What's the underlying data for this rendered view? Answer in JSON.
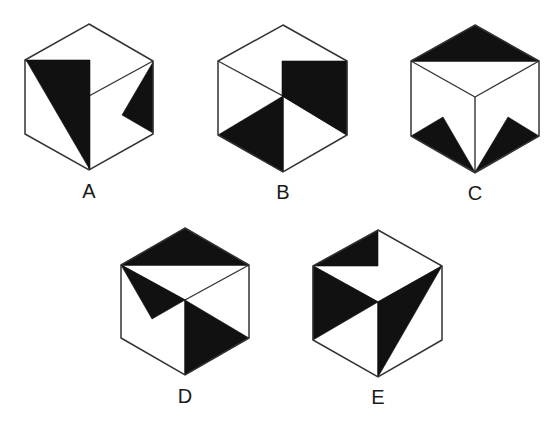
{
  "diagram": {
    "stroke_color": "#333333",
    "fill_color": "#111111",
    "background": "#ffffff",
    "cubes": [
      {
        "id": "A",
        "label": "A",
        "label_pos": [
          89,
          181
        ],
        "outline": [
          [
            89,
            24
          ],
          [
            153,
            61
          ],
          [
            153,
            134
          ],
          [
            89,
            170
          ],
          [
            25,
            134
          ],
          [
            25,
            60
          ]
        ],
        "edges": [
          [
            [
              89,
              96
            ],
            [
              153,
              61
            ]
          ],
          [
            [
              89,
              96
            ],
            [
              89,
              170
            ]
          ],
          [
            [
              25,
              60
            ],
            [
              89,
              96
            ]
          ]
        ],
        "shaded": [
          [
            [
              26,
              60
            ],
            [
              90,
              60
            ],
            [
              90,
              170
            ]
          ],
          [
            [
              153,
              62
            ],
            [
              122,
              115
            ],
            [
              153,
              133
            ]
          ]
        ]
      },
      {
        "id": "B",
        "label": "B",
        "label_pos": [
          283,
          182
        ],
        "outline": [
          [
            283,
            25
          ],
          [
            347,
            61
          ],
          [
            347,
            135
          ],
          [
            283,
            172
          ],
          [
            218,
            135
          ],
          [
            218,
            61
          ]
        ],
        "edges": [
          [
            [
              218,
              61
            ],
            [
              283,
              96
            ]
          ],
          [
            [
              283,
              96
            ],
            [
              283,
              172
            ]
          ],
          [
            [
              283,
              96
            ],
            [
              347,
              135
            ]
          ]
        ],
        "shaded": [
          [
            [
              282,
              61
            ],
            [
              347,
              61
            ],
            [
              347,
              135
            ],
            [
              282,
              96
            ]
          ],
          [
            [
              218,
              135
            ],
            [
              283,
              96
            ],
            [
              283,
              172
            ]
          ]
        ]
      },
      {
        "id": "C",
        "label": "C",
        "label_pos": [
          475,
          183
        ],
        "outline": [
          [
            475,
            25
          ],
          [
            539,
            61
          ],
          [
            539,
            136
          ],
          [
            475,
            173
          ],
          [
            411,
            136
          ],
          [
            411,
            61
          ]
        ],
        "edges": [
          [
            [
              411,
              61
            ],
            [
              475,
              97
            ]
          ],
          [
            [
              475,
              97
            ],
            [
              539,
              61
            ]
          ],
          [
            [
              475,
              97
            ],
            [
              475,
              173
            ]
          ],
          [
            [
              411,
              61
            ],
            [
              539,
              61
            ]
          ]
        ],
        "shaded": [
          [
            [
              475,
              25
            ],
            [
              411,
              61
            ],
            [
              539,
              61
            ]
          ],
          [
            [
              411,
              136
            ],
            [
              443,
              117
            ],
            [
              475,
              172
            ]
          ],
          [
            [
              475,
              172
            ],
            [
              508,
              117
            ],
            [
              539,
              136
            ]
          ]
        ]
      },
      {
        "id": "D",
        "label": "D",
        "label_pos": [
          185,
          386
        ],
        "outline": [
          [
            185,
            228
          ],
          [
            249,
            265
          ],
          [
            249,
            338
          ],
          [
            185,
            375
          ],
          [
            121,
            338
          ],
          [
            121,
            265
          ]
        ],
        "edges": [
          [
            [
              121,
              265
            ],
            [
              185,
              300
            ]
          ],
          [
            [
              185,
              300
            ],
            [
              249,
              265
            ]
          ],
          [
            [
              185,
              300
            ],
            [
              185,
              375
            ]
          ],
          [
            [
              121,
              265
            ],
            [
              249,
              265
            ]
          ]
        ],
        "shaded": [
          [
            [
              185,
              228
            ],
            [
              121,
              265
            ],
            [
              249,
              265
            ]
          ],
          [
            [
              121,
              265
            ],
            [
              185,
              300
            ],
            [
              152,
              319
            ]
          ],
          [
            [
              185,
              300
            ],
            [
              249,
              338
            ],
            [
              185,
              375
            ]
          ]
        ]
      },
      {
        "id": "E",
        "label": "E",
        "label_pos": [
          378,
          387
        ],
        "outline": [
          [
            378,
            230
          ],
          [
            442,
            266
          ],
          [
            442,
            340
          ],
          [
            378,
            377
          ],
          [
            313,
            340
          ],
          [
            313,
            266
          ]
        ],
        "edges": [
          [
            [
              313,
              266
            ],
            [
              378,
              302
            ]
          ],
          [
            [
              378,
              302
            ],
            [
              442,
              266
            ]
          ],
          [
            [
              378,
              302
            ],
            [
              378,
              377
            ]
          ]
        ],
        "shaded": [
          [
            [
              378,
              230
            ],
            [
              313,
              266
            ],
            [
              378,
              266
            ]
          ],
          [
            [
              313,
              266
            ],
            [
              378,
              302
            ],
            [
              313,
              340
            ]
          ],
          [
            [
              378,
              302
            ],
            [
              442,
              266
            ],
            [
              378,
              377
            ]
          ]
        ]
      }
    ]
  }
}
